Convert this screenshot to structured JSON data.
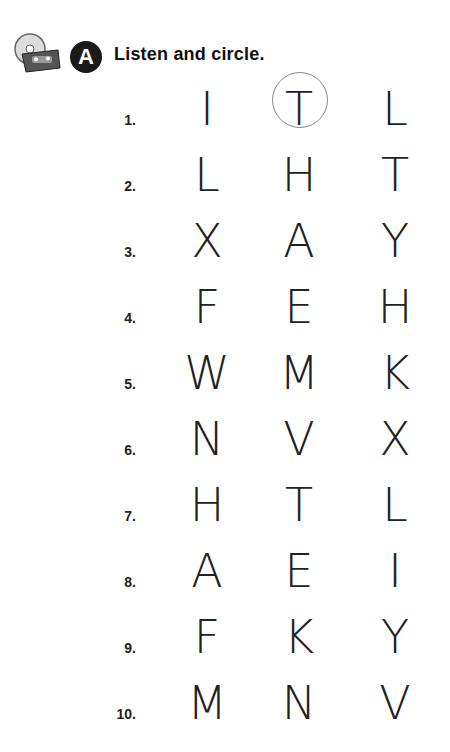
{
  "header": {
    "icon": "cd-cassette-icon",
    "badge": "A",
    "title": "Listen and circle."
  },
  "accent": {
    "circle": "#888888",
    "badge_bg": "#1a1a1a"
  },
  "rows": [
    {
      "num": "1.",
      "letters": [
        "I",
        "T",
        "L"
      ],
      "circled": 1
    },
    {
      "num": "2.",
      "letters": [
        "L",
        "H",
        "T"
      ],
      "circled": null
    },
    {
      "num": "3.",
      "letters": [
        "X",
        "A",
        "Y"
      ],
      "circled": null
    },
    {
      "num": "4.",
      "letters": [
        "F",
        "E",
        "H"
      ],
      "circled": null
    },
    {
      "num": "5.",
      "letters": [
        "W",
        "M",
        "K"
      ],
      "circled": null
    },
    {
      "num": "6.",
      "letters": [
        "N",
        "V",
        "X"
      ],
      "circled": null
    },
    {
      "num": "7.",
      "letters": [
        "H",
        "T",
        "L"
      ],
      "circled": null
    },
    {
      "num": "8.",
      "letters": [
        "A",
        "E",
        "I"
      ],
      "circled": null
    },
    {
      "num": "9.",
      "letters": [
        "F",
        "K",
        "Y"
      ],
      "circled": null
    },
    {
      "num": "10.",
      "letters": [
        "M",
        "N",
        "V"
      ],
      "circled": null
    }
  ]
}
